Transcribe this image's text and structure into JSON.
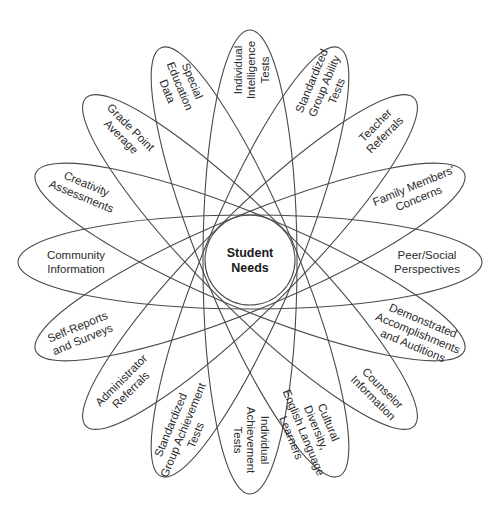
{
  "diagram": {
    "center": {
      "x": 250,
      "y": 262
    },
    "ellipse": {
      "rx": 232,
      "ry": 47,
      "count": 8,
      "step_deg": 22.5,
      "stroke": "#4a4a4a"
    },
    "hub": {
      "radius": 45,
      "lines": [
        "Student",
        "Needs"
      ]
    },
    "petals": [
      {
        "name": "individual-intelligence-tests",
        "lines": [
          "Individual",
          "Intelligence",
          "Tests"
        ],
        "x": 251,
        "y": 70,
        "rot": -90
      },
      {
        "name": "standardized-group-ability-tests",
        "lines": [
          "Standardized",
          "Group Ability",
          "Tests"
        ],
        "x": 324,
        "y": 86,
        "rot": -67.5
      },
      {
        "name": "teacher-referrals",
        "lines": [
          "Teacher",
          "Referrals"
        ],
        "x": 380,
        "y": 130,
        "rot": -45
      },
      {
        "name": "family-members-concerns",
        "lines": [
          "Family Members'",
          "Concerns"
        ],
        "x": 416,
        "y": 192,
        "rot": -22.5
      },
      {
        "name": "peer-social-perspectives",
        "lines": [
          "Peer/Social",
          "Perspectives"
        ],
        "x": 427,
        "y": 262,
        "rot": 0
      },
      {
        "name": "demonstrated-accomplishments-and-auditions",
        "lines": [
          "Demonstrated",
          "Accomplishments",
          "and Auditions"
        ],
        "x": 418,
        "y": 333,
        "rot": 22.5
      },
      {
        "name": "counselor-information",
        "lines": [
          "Counselor",
          "Information"
        ],
        "x": 378,
        "y": 393,
        "rot": 45
      },
      {
        "name": "cultural-diversity-english-language-learners",
        "lines": [
          "Cultural",
          "Diversity,",
          "English Language",
          "Learners"
        ],
        "x": 310,
        "y": 430,
        "rot": 67.5
      },
      {
        "name": "individual-achievement-tests",
        "lines": [
          "Individual",
          "Achievement",
          "Tests"
        ],
        "x": 251,
        "y": 440,
        "rot": 90
      },
      {
        "name": "standardized-group-achievement-tests",
        "lines": [
          "Standardized",
          "Group Achievement",
          "Tests"
        ],
        "x": 183,
        "y": 430,
        "rot": -67.5
      },
      {
        "name": "administrator-referrals",
        "lines": [
          "Administrator",
          "Referrals"
        ],
        "x": 126,
        "y": 385,
        "rot": -45
      },
      {
        "name": "self-reports-and-surveys",
        "lines": [
          "Self-Reports",
          "and Surveys"
        ],
        "x": 80,
        "y": 333,
        "rot": -22.5
      },
      {
        "name": "community-information",
        "lines": [
          "Community",
          "Information"
        ],
        "x": 76,
        "y": 262,
        "rot": 0
      },
      {
        "name": "creativity-assessments",
        "lines": [
          "Creativity",
          "Assessments"
        ],
        "x": 84,
        "y": 190,
        "rot": 22.5
      },
      {
        "name": "grade-point-average",
        "lines": [
          "Grade Point",
          "Average"
        ],
        "x": 126,
        "y": 132,
        "rot": 45
      },
      {
        "name": "special-education-data",
        "lines": [
          "Special",
          "Education",
          "Data"
        ],
        "x": 180,
        "y": 86,
        "rot": 67.5
      }
    ]
  }
}
